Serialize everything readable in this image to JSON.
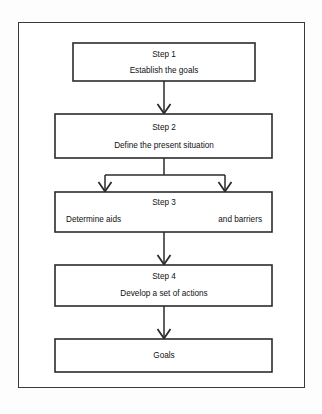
{
  "diagram": {
    "type": "flowchart",
    "orientation": "vertical",
    "title": "",
    "frame": {
      "border_color": "#3a3a3a",
      "background": "#ffffff"
    },
    "line_color": "#2b2b2b",
    "arrowhead_style": "open-chevron",
    "nodes": [
      {
        "id": "step1",
        "shape": "rectangle",
        "heading": "Step 1",
        "lines": [
          {
            "text": "Establish the goals",
            "align": "center"
          }
        ]
      },
      {
        "id": "step2",
        "shape": "rectangle",
        "heading": "Step 2",
        "lines": [
          {
            "text": "Define the present situation",
            "align": "center"
          }
        ]
      },
      {
        "id": "step3",
        "shape": "rectangle",
        "heading": "Step 3",
        "lines": [
          {
            "text": "Determine aids",
            "align": "left"
          },
          {
            "text": "and barriers",
            "align": "right"
          }
        ]
      },
      {
        "id": "step4",
        "shape": "rectangle",
        "heading": "Step 4",
        "lines": [
          {
            "text": "Develop a set of actions",
            "align": "center"
          }
        ]
      },
      {
        "id": "goals",
        "shape": "rectangle",
        "heading": "",
        "lines": [
          {
            "text": "Goals",
            "align": "center"
          }
        ]
      }
    ],
    "edges": [
      {
        "from": "step1",
        "to": "step2",
        "style": "straight-down",
        "arrows": 1
      },
      {
        "from": "step2",
        "to": "step3",
        "style": "fork-two-branches",
        "arrows": 2
      },
      {
        "from": "step3",
        "to": "step4",
        "style": "straight-down",
        "arrows": 1
      },
      {
        "from": "step4",
        "to": "goals",
        "style": "straight-down",
        "arrows": 1
      }
    ]
  }
}
